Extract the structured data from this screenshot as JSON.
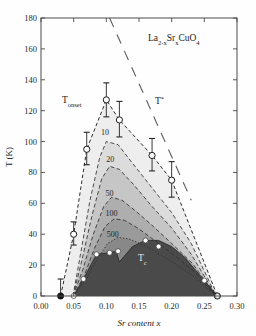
{
  "figure": {
    "compound_label": "La",
    "compound_sub1": "2-x",
    "compound_el2": "Sr",
    "compound_sub2": "x",
    "compound_el3": "CuO",
    "compound_sub3": "4",
    "background": "#ffffff",
    "frame_color": "#555555"
  },
  "axes": {
    "xlabel_main": "Sr content ",
    "xlabel_italic": "x",
    "ylabel": "T (K)",
    "x_ticks": [
      "0.00",
      "0.05",
      "0.10",
      "0.15",
      "0.20",
      "0.25",
      "0.30"
    ],
    "x_tick_values": [
      0.0,
      0.05,
      0.1,
      0.15,
      0.2,
      0.25,
      0.3
    ],
    "y_ticks": [
      "0",
      "20",
      "40",
      "60",
      "80",
      "100",
      "120",
      "140",
      "160",
      "180"
    ],
    "y_tick_values": [
      0,
      20,
      40,
      60,
      80,
      100,
      120,
      140,
      160,
      180
    ],
    "xlim": [
      0.0,
      0.3
    ],
    "ylim": [
      0,
      180
    ]
  },
  "annotations": {
    "t_onset_base": "T",
    "t_onset_sub": "onset",
    "t_star": "T",
    "t_star_sup": "*",
    "tc_base": "T",
    "tc_sub": "c"
  },
  "chart_data": {
    "type": "line",
    "title": "",
    "subtitle": "",
    "xlabel": "Sr content x",
    "ylabel": "T (K)",
    "xlim": [
      0.0,
      0.3
    ],
    "ylim": [
      0,
      180
    ],
    "grid": false,
    "legend": "none",
    "contour_labels": [
      "10",
      "20",
      "50",
      "100",
      "500"
    ],
    "contour_label_positions": [
      {
        "label": "10",
        "x": 0.098,
        "y": 104
      },
      {
        "label": "20",
        "x": 0.106,
        "y": 87
      },
      {
        "label": "50",
        "x": 0.105,
        "y": 65
      },
      {
        "label": "100",
        "x": 0.108,
        "y": 52
      },
      {
        "label": "500",
        "x": 0.11,
        "y": 38
      }
    ],
    "series": [
      {
        "name": "T_onset",
        "style": "dashed-open-circles",
        "color": "#333333",
        "fill": "#eeeeee",
        "x": [
          0.03,
          0.05,
          0.07,
          0.1,
          0.12,
          0.17,
          0.2,
          0.27
        ],
        "values": [
          0,
          40,
          95,
          127,
          114,
          91,
          75,
          0
        ],
        "err_up": [
          11,
          8,
          11,
          11,
          12,
          11,
          12,
          0
        ],
        "err_down": [
          11,
          7,
          10,
          11,
          11,
          10,
          11,
          0
        ],
        "markers": [
          {
            "x": 0.03,
            "y": 0,
            "type": "filled"
          },
          {
            "x": 0.05,
            "y": 40,
            "type": "open"
          },
          {
            "x": 0.07,
            "y": 95,
            "type": "open"
          },
          {
            "x": 0.1,
            "y": 127,
            "type": "open"
          },
          {
            "x": 0.12,
            "y": 114,
            "type": "open"
          },
          {
            "x": 0.17,
            "y": 91,
            "type": "open"
          },
          {
            "x": 0.2,
            "y": 75,
            "type": "open"
          },
          {
            "x": 0.27,
            "y": 0,
            "type": "open"
          }
        ]
      },
      {
        "name": "contour-10",
        "style": "dashed",
        "fill": "#dcdcdc",
        "x": [
          0.049,
          0.06,
          0.075,
          0.09,
          0.1,
          0.118,
          0.14,
          0.17,
          0.2,
          0.23,
          0.268
        ],
        "values": [
          0,
          26,
          62,
          90,
          100,
          98,
          86,
          70,
          54,
          34,
          0
        ]
      },
      {
        "name": "contour-20",
        "style": "dashed",
        "fill": "#c6c6c6",
        "x": [
          0.049,
          0.062,
          0.078,
          0.093,
          0.105,
          0.12,
          0.142,
          0.17,
          0.2,
          0.23,
          0.268
        ],
        "values": [
          0,
          22,
          52,
          76,
          84,
          82,
          72,
          58,
          44,
          27,
          0
        ]
      },
      {
        "name": "contour-50",
        "style": "dashed",
        "fill": "#aeaeae",
        "x": [
          0.049,
          0.064,
          0.08,
          0.096,
          0.108,
          0.124,
          0.145,
          0.172,
          0.2,
          0.232,
          0.268
        ],
        "values": [
          0,
          17,
          40,
          58,
          64,
          62,
          55,
          45,
          34,
          21,
          0
        ]
      },
      {
        "name": "contour-100",
        "style": "dashed",
        "fill": "#9a9a9a",
        "x": [
          0.049,
          0.066,
          0.082,
          0.098,
          0.112,
          0.128,
          0.148,
          0.174,
          0.202,
          0.234,
          0.268
        ],
        "values": [
          0,
          13,
          31,
          45,
          50,
          49,
          44,
          36,
          27,
          16,
          0
        ]
      },
      {
        "name": "contour-500",
        "style": "dotted",
        "fill": "#888888",
        "x": [
          0.049,
          0.068,
          0.085,
          0.102,
          0.118,
          0.134,
          0.152,
          0.178,
          0.205,
          0.236,
          0.268
        ],
        "values": [
          0,
          10,
          23,
          34,
          38,
          37,
          34,
          28,
          21,
          12,
          0
        ]
      },
      {
        "name": "T_c",
        "style": "solid-dark-filled",
        "color": "#4a4a4a",
        "fill": "#4a4a4a",
        "x": [
          0.05,
          0.065,
          0.085,
          0.105,
          0.115,
          0.12,
          0.14,
          0.16,
          0.18,
          0.2,
          0.22,
          0.25,
          0.27
        ],
        "values": [
          0,
          11,
          27,
          28,
          29,
          22,
          32,
          36,
          36,
          32,
          25,
          10,
          0
        ],
        "markers": [
          {
            "x": 0.05,
            "y": 0,
            "type": "white"
          },
          {
            "x": 0.065,
            "y": 11,
            "type": "white"
          },
          {
            "x": 0.085,
            "y": 27,
            "type": "white"
          },
          {
            "x": 0.105,
            "y": 28,
            "type": "white"
          },
          {
            "x": 0.118,
            "y": 29,
            "type": "white"
          },
          {
            "x": 0.16,
            "y": 36,
            "type": "white"
          },
          {
            "x": 0.18,
            "y": 32,
            "type": "white"
          },
          {
            "x": 0.25,
            "y": 10,
            "type": "white"
          },
          {
            "x": 0.27,
            "y": 0,
            "type": "white"
          }
        ]
      },
      {
        "name": "T_star",
        "style": "long-dashed",
        "color": "#5a5a5a",
        "x": [
          0.105,
          0.23
        ],
        "values": [
          180,
          62
        ]
      }
    ]
  }
}
